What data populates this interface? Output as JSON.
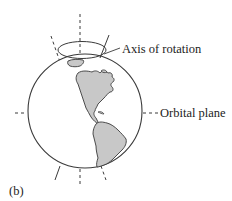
{
  "figure": {
    "panel_label": "(b)",
    "labels": {
      "axis_of_rotation": "Axis of rotation",
      "orbital_plane": "Orbital plane"
    },
    "colors": {
      "line": "#3a3a3a",
      "land": "#c8c8c8",
      "ocean": "#ffffff",
      "text": "#222222"
    },
    "elements": [
      "earth-globe",
      "rotation-ellipse",
      "tilted-rotation-axis",
      "vertical-dashed-reference",
      "orbital-plane-dashed-line",
      "north-america",
      "south-america",
      "greenland"
    ]
  }
}
